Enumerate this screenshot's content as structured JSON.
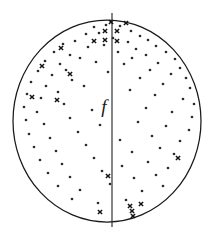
{
  "figure": {
    "type": "scatter-in-circle",
    "width": 219,
    "height": 232,
    "background_color": "#ffffff",
    "stroke_color": "#1a1a1a",
    "axis_label": "f"
  },
  "chart_data": {
    "type": "scatter",
    "title": "",
    "subtitle": "",
    "xlabel": "",
    "ylabel": "",
    "annotations": [
      {
        "text": "f",
        "x": 104,
        "y": 113,
        "style": "italic",
        "description": "fault-plane / symmetry axis label left of vertical line"
      }
    ],
    "grid": false,
    "legend": null,
    "boundary": {
      "shape": "circle",
      "center_x": 107,
      "center_y": 121,
      "radius_x": 94,
      "radius_y": 101,
      "description": "projection net primitive circle"
    },
    "reference_line": {
      "orientation": "vertical",
      "x": 112,
      "y_start": 13,
      "y_end": 227,
      "description": "vertical trace line extending beyond circle at top and bottom"
    },
    "series": [
      {
        "name": "dots",
        "marker": "dot",
        "marker_size": 1.35,
        "count": 96,
        "points": [
          [
            94,
            27
          ],
          [
            106,
            25
          ],
          [
            120,
            26
          ],
          [
            131,
            31
          ],
          [
            86,
            34
          ],
          [
            99,
            33
          ],
          [
            140,
            36
          ],
          [
            148,
            40
          ],
          [
            63,
            44
          ],
          [
            75,
            41
          ],
          [
            113,
            38
          ],
          [
            128,
            42
          ],
          [
            156,
            46
          ],
          [
            166,
            52
          ],
          [
            54,
            52
          ],
          [
            70,
            55
          ],
          [
            88,
            47
          ],
          [
            104,
            45
          ],
          [
            136,
            49
          ],
          [
            146,
            55
          ],
          [
            175,
            59
          ],
          [
            45,
            61
          ],
          [
            60,
            64
          ],
          [
            80,
            58
          ],
          [
            118,
            52
          ],
          [
            132,
            58
          ],
          [
            158,
            63
          ],
          [
            180,
            68
          ],
          [
            38,
            71
          ],
          [
            52,
            75
          ],
          [
            66,
            70
          ],
          [
            96,
            62
          ],
          [
            124,
            64
          ],
          [
            150,
            70
          ],
          [
            171,
            74
          ],
          [
            186,
            78
          ],
          [
            31,
            82
          ],
          [
            46,
            86
          ],
          [
            72,
            80
          ],
          [
            108,
            72
          ],
          [
            140,
            78
          ],
          [
            163,
            84
          ],
          [
            190,
            88
          ],
          [
            27,
            94
          ],
          [
            41,
            98
          ],
          [
            58,
            92
          ],
          [
            84,
            86
          ],
          [
            130,
            90
          ],
          [
            155,
            95
          ],
          [
            183,
            99
          ],
          [
            194,
            104
          ],
          [
            24,
            107
          ],
          [
            37,
            112
          ],
          [
            64,
            104
          ],
          [
            92,
            110
          ],
          [
            146,
            108
          ],
          [
            172,
            112
          ],
          [
            192,
            117
          ],
          [
            26,
            120
          ],
          [
            44,
            124
          ],
          [
            70,
            118
          ],
          [
            100,
            125
          ],
          [
            138,
            122
          ],
          [
            166,
            126
          ],
          [
            189,
            130
          ],
          [
            29,
            134
          ],
          [
            50,
            138
          ],
          [
            78,
            132
          ],
          [
            120,
            140
          ],
          [
            152,
            136
          ],
          [
            180,
            141
          ],
          [
            34,
            147
          ],
          [
            56,
            151
          ],
          [
            86,
            145
          ],
          [
            132,
            152
          ],
          [
            160,
            148
          ],
          [
            174,
            154
          ],
          [
            40,
            160
          ],
          [
            62,
            164
          ],
          [
            94,
            158
          ],
          [
            122,
            166
          ],
          [
            148,
            162
          ],
          [
            168,
            168
          ],
          [
            48,
            173
          ],
          [
            70,
            177
          ],
          [
            102,
            171
          ],
          [
            134,
            178
          ],
          [
            156,
            175
          ],
          [
            58,
            186
          ],
          [
            80,
            190
          ],
          [
            110,
            184
          ],
          [
            142,
            191
          ],
          [
            163,
            186
          ],
          [
            72,
            199
          ],
          [
            98,
            203
          ],
          [
            126,
            200
          ]
        ]
      },
      {
        "name": "crosses",
        "marker": "x",
        "marker_size": 4.2,
        "count": 21,
        "points": [
          [
            111,
            22
          ],
          [
            126,
            23
          ],
          [
            105,
            31
          ],
          [
            117,
            31
          ],
          [
            105,
            40
          ],
          [
            117,
            41
          ],
          [
            94,
            41
          ],
          [
            61,
            48
          ],
          [
            42,
            66
          ],
          [
            70,
            74
          ],
          [
            32,
            97
          ],
          [
            57,
            100
          ],
          [
            178,
            158
          ],
          [
            108,
            176
          ],
          [
            100,
            212
          ],
          [
            130,
            206
          ],
          [
            132,
            211
          ],
          [
            133,
            216
          ],
          [
            141,
            204
          ]
        ]
      }
    ]
  }
}
